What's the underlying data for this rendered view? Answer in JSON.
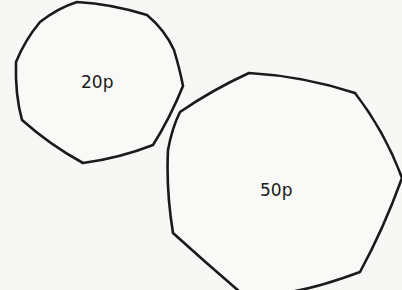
{
  "coins": [
    {
      "label": "20p",
      "shape": "heptagon"
    },
    {
      "label": "50p",
      "shape": "heptagon"
    }
  ],
  "colors": {
    "background": "#f7f7f5",
    "outline": "#1a1a1a"
  }
}
